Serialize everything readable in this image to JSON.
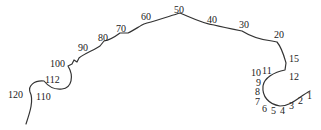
{
  "diagram": {
    "type": "numbered-curve",
    "stroke_color": "#333333",
    "labels": [
      {
        "text": "1",
        "x": 307,
        "y": 91
      },
      {
        "text": "2",
        "x": 298,
        "y": 96
      },
      {
        "text": "3",
        "x": 289,
        "y": 101
      },
      {
        "text": "4",
        "x": 280,
        "y": 106
      },
      {
        "text": "5",
        "x": 271,
        "y": 106
      },
      {
        "text": "6",
        "x": 262,
        "y": 104
      },
      {
        "text": "7",
        "x": 255,
        "y": 97
      },
      {
        "text": "8",
        "x": 255,
        "y": 87
      },
      {
        "text": "9",
        "x": 256,
        "y": 78
      },
      {
        "text": "10",
        "x": 251,
        "y": 68
      },
      {
        "text": "11",
        "x": 262,
        "y": 66
      },
      {
        "text": "12",
        "x": 289,
        "y": 72
      },
      {
        "text": "15",
        "x": 289,
        "y": 54
      },
      {
        "text": "20",
        "x": 274,
        "y": 30
      },
      {
        "text": "30",
        "x": 239,
        "y": 20
      },
      {
        "text": "40",
        "x": 207,
        "y": 15
      },
      {
        "text": "50",
        "x": 174,
        "y": 5
      },
      {
        "text": "60",
        "x": 141,
        "y": 12
      },
      {
        "text": "70",
        "x": 116,
        "y": 24
      },
      {
        "text": "80",
        "x": 98,
        "y": 33
      },
      {
        "text": "90",
        "x": 78,
        "y": 43
      },
      {
        "text": "100",
        "x": 50,
        "y": 59
      },
      {
        "text": "112",
        "x": 45,
        "y": 75
      },
      {
        "text": "110",
        "x": 36,
        "y": 92
      },
      {
        "text": "120",
        "x": 8,
        "y": 90
      }
    ]
  }
}
